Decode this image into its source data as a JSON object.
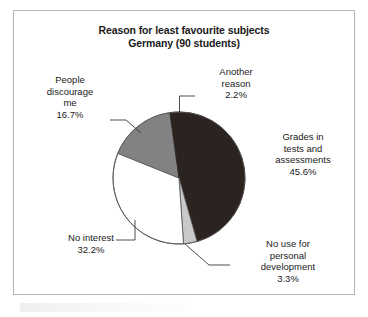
{
  "figure": {
    "title_line1": "Reason for least favourite subjects",
    "title_line2": "Germany (90 students)",
    "frame_color": "#b4b4b4",
    "background": "#ffffff"
  },
  "labels": {
    "another_reason": "Another\nreason\n2.2%",
    "people_discourage": "People\ndiscourage\nme\n16.7%",
    "grades": "Grades in\ntests and\nassessments\n45.6%",
    "no_interest": "No interest\n32.2%",
    "no_use": "No use for\npersonal\ndevelopment\n3.3%"
  },
  "chart_data": {
    "type": "pie",
    "title": "Reason for least favourite subjects Germany (90 students)",
    "subtitle": "Germany (90 students)",
    "xlabel": "",
    "ylabel": "",
    "units": "percent",
    "total_respondents": 90,
    "legend": "none (labels placed outside slices with leader lines)",
    "start_angle_deg": 0,
    "direction": "clockwise",
    "categories": [
      "Grades in tests and assessments",
      "No use for personal development",
      "No interest",
      "People discourage me",
      "Another reason"
    ],
    "values": [
      45.6,
      3.3,
      32.2,
      16.7,
      2.2
    ],
    "value_labels": [
      "45.6%",
      "3.3%",
      "32.2%",
      "16.7%",
      "2.2%"
    ],
    "colors": [
      "#2b2320",
      "#c9c9c9",
      "#ffffff",
      "#828282",
      "#2b2320"
    ],
    "slices": [
      {
        "label": "Grades in tests and assessments",
        "value": 45.6,
        "display": "45.6%",
        "color": "#2b2320"
      },
      {
        "label": "No use for personal development",
        "value": 3.3,
        "display": "3.3%",
        "color": "#c9c9c9"
      },
      {
        "label": "No interest",
        "value": 32.2,
        "display": "32.2%",
        "color": "#ffffff"
      },
      {
        "label": "People discourage me",
        "value": 16.7,
        "display": "16.7%",
        "color": "#828282"
      },
      {
        "label": "Another reason",
        "value": 2.2,
        "display": "2.2%",
        "color": "#2b2320"
      }
    ]
  }
}
